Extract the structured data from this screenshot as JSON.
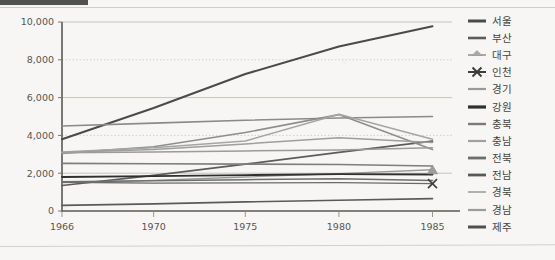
{
  "page": {
    "background_color": "#f7f6f4",
    "scan_artifact_bar_color": "#3a3a3a"
  },
  "chart_data": {
    "type": "line",
    "title": "",
    "subtitle": "",
    "xlabel": "",
    "ylabel": "",
    "x": [
      1966,
      1970,
      1975,
      1980,
      1985
    ],
    "xtick_labels": [
      "1966",
      "1970",
      "1975",
      "1980",
      "1985"
    ],
    "xtick_positions_frac": [
      0.0,
      0.235,
      0.47,
      0.71,
      0.95
    ],
    "ylim": [
      0,
      10000
    ],
    "ytick_labels": [
      "0",
      "2,000",
      "4,000",
      "6,000",
      "8,000",
      "10,000"
    ],
    "ytick_values": [
      0,
      2000,
      4000,
      6000,
      8000,
      10000
    ],
    "grid": true,
    "grid_style": "alternating solid and dotted horizontal lines",
    "legend_position": "right",
    "series": [
      {
        "name": "서울",
        "values": [
          3800,
          5450,
          7250,
          8700,
          9780
        ],
        "color": "#4a4a4a",
        "width": 2.0,
        "marker": "none"
      },
      {
        "name": "부산",
        "values": [
          1350,
          1880,
          2480,
          3100,
          3700
        ],
        "color": "#5c5c5c",
        "width": 1.7,
        "marker": "none"
      },
      {
        "name": "대구",
        "values": [
          1500,
          1620,
          1800,
          1980,
          2180
        ],
        "color": "#9a9a9a",
        "width": 1.4,
        "marker": "triangle"
      },
      {
        "name": "인천",
        "values": [
          1520,
          1480,
          1490,
          1500,
          1450
        ],
        "color": "#6b6b6b",
        "width": 1.3,
        "marker": "x"
      },
      {
        "name": "경기",
        "values": [
          3050,
          3400,
          4150,
          5100,
          3250
        ],
        "color": "#8e8e8e",
        "width": 1.6,
        "marker": "none"
      },
      {
        "name": "강원",
        "values": [
          1800,
          1850,
          1900,
          1950,
          1930
        ],
        "color": "#2f2f2f",
        "width": 1.8,
        "marker": "none"
      },
      {
        "name": "충북",
        "values": [
          1550,
          1600,
          1660,
          1700,
          1620
        ],
        "color": "#6f6f6f",
        "width": 1.5,
        "marker": "none"
      },
      {
        "name": "충남",
        "values": [
          3080,
          3120,
          3180,
          3230,
          3350
        ],
        "color": "#9b9b9b",
        "width": 1.5,
        "marker": "none"
      },
      {
        "name": "전북",
        "values": [
          2520,
          2500,
          2480,
          2460,
          2380
        ],
        "color": "#7d7d7d",
        "width": 1.6,
        "marker": "none"
      },
      {
        "name": "전남",
        "values": [
          4500,
          4650,
          4800,
          4920,
          5000
        ],
        "color": "#8a8a8a",
        "width": 1.6,
        "marker": "none"
      },
      {
        "name": "경북",
        "values": [
          3120,
          3350,
          3700,
          5120,
          3800
        ],
        "color": "#a5a5a5",
        "width": 1.5,
        "marker": "none"
      },
      {
        "name": "경남",
        "values": [
          3100,
          3250,
          3550,
          3880,
          3620
        ],
        "color": "#9e9e9e",
        "width": 1.5,
        "marker": "none"
      },
      {
        "name": "제주",
        "values": [
          300,
          380,
          480,
          570,
          650
        ],
        "color": "#5a5a5a",
        "width": 1.7,
        "marker": "none"
      }
    ]
  },
  "legend": {
    "items": [
      {
        "label": "서울",
        "color": "#4a4a4a",
        "width": 3.0,
        "marker": "none"
      },
      {
        "label": "부산",
        "color": "#5c5c5c",
        "width": 2.6,
        "marker": "none"
      },
      {
        "label": "대구",
        "color": "#a8a8a8",
        "width": 2.0,
        "marker": "triangle"
      },
      {
        "label": "인천",
        "color": "#3d3d3d",
        "width": 2.0,
        "marker": "x"
      },
      {
        "label": "경기",
        "color": "#9a9a9a",
        "width": 2.2,
        "marker": "none"
      },
      {
        "label": "강원",
        "color": "#2f2f2f",
        "width": 3.2,
        "marker": "none"
      },
      {
        "label": "충북",
        "color": "#7a7a7a",
        "width": 2.4,
        "marker": "none"
      },
      {
        "label": "충남",
        "color": "#a0a0a0",
        "width": 2.2,
        "marker": "none"
      },
      {
        "label": "전북",
        "color": "#6d6d6d",
        "width": 2.8,
        "marker": "none"
      },
      {
        "label": "전남",
        "color": "#585858",
        "width": 2.8,
        "marker": "none"
      },
      {
        "label": "경북",
        "color": "#b0b0b0",
        "width": 2.0,
        "marker": "none"
      },
      {
        "label": "경남",
        "color": "#9c9c9c",
        "width": 2.2,
        "marker": "none"
      },
      {
        "label": "제주",
        "color": "#4f4f4f",
        "width": 3.0,
        "marker": "none"
      }
    ]
  }
}
